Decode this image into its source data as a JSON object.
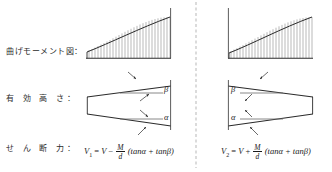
{
  "labels": {
    "bending_moment": "曲げモーメント図：",
    "effective_depth": "有 効 高 さ：",
    "shear_force": "せ ん 断 力："
  },
  "formulas": {
    "left": {
      "lhs": "V",
      "lhs_sub": "1",
      "eq": "=",
      "v": "V",
      "sign": "−",
      "numerator": "M",
      "denominator": "d",
      "trig": "(tanα + tanβ)"
    },
    "right": {
      "lhs": "V",
      "lhs_sub": "2",
      "eq": "=",
      "v": "V",
      "sign": "+",
      "numerator": "M",
      "denominator": "d",
      "trig": "(tanα + tanβ)"
    }
  },
  "angles": {
    "left": {
      "beta": "β",
      "alpha": "α"
    },
    "right": {
      "beta": "β",
      "alpha": "α"
    }
  },
  "colors": {
    "ink": "#1a1a1a",
    "hatch": "#8a8a8a",
    "rule": "#555555",
    "background": "#ffffff"
  },
  "diagram": {
    "left_panel": {
      "bmd_shape": "rising-curve-with-vertical-hatching",
      "depth_shape": "tapered-beam-widening-to-right"
    },
    "right_panel": {
      "bmd_shape": "rising-curve-with-vertical-hatching",
      "depth_shape": "tapered-beam-narrowing-to-right"
    }
  }
}
